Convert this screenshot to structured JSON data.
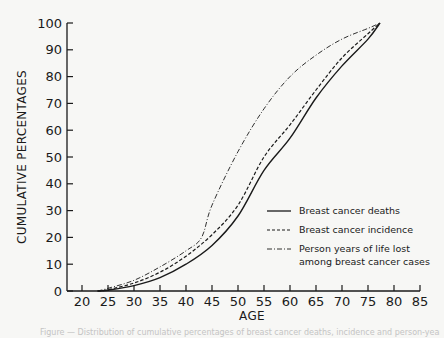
{
  "chart_data": {
    "type": "line",
    "title": "",
    "xlabel": "AGE",
    "ylabel": "CUMULATIVE PERCENTAGES",
    "xlim": [
      17,
      85
    ],
    "ylim": [
      0,
      100
    ],
    "xticks": [
      20,
      25,
      30,
      35,
      40,
      45,
      50,
      55,
      60,
      65,
      70,
      75,
      80,
      85
    ],
    "yticks": [
      0,
      10,
      20,
      30,
      40,
      50,
      60,
      70,
      80,
      90,
      100
    ],
    "grid": false,
    "legend_position": "lower right (inside plot)",
    "series": [
      {
        "name": "Breast cancer deaths",
        "style": "solid",
        "x": [
          23,
          25,
          30,
          35,
          40,
          45,
          50,
          55,
          60,
          65,
          70,
          75,
          77.3
        ],
        "y": [
          0,
          0.3,
          2,
          5,
          10,
          17,
          28,
          45,
          57,
          72,
          84,
          94,
          100
        ]
      },
      {
        "name": "Breast cancer incidence",
        "style": "dashed",
        "x": [
          23,
          25,
          30,
          35,
          40,
          45,
          50,
          55,
          60,
          65,
          70,
          75,
          77.3
        ],
        "y": [
          0,
          0.5,
          3,
          7,
          13,
          21,
          32,
          50,
          62,
          75,
          87,
          96,
          100
        ]
      },
      {
        "name": "Person years of life lost among breast cancer cases",
        "style": "dash-dot",
        "x": [
          23,
          25,
          30,
          35,
          40,
          43,
          45,
          50,
          55,
          60,
          65,
          70,
          75,
          77.3
        ],
        "y": [
          0,
          1,
          4,
          9,
          15,
          20,
          32,
          52,
          68,
          80,
          88,
          94,
          98,
          100
        ]
      }
    ]
  },
  "axes": {
    "xlabel": "AGE",
    "ylabel": "CUMULATIVE PERCENTAGES",
    "xtick_labels": [
      "20",
      "25",
      "30",
      "35",
      "40",
      "45",
      "50",
      "55",
      "60",
      "65",
      "70",
      "75",
      "80",
      "85"
    ],
    "ytick_labels": [
      "0",
      "10",
      "20",
      "30",
      "40",
      "50",
      "60",
      "70",
      "80",
      "90",
      "100"
    ]
  },
  "legend": {
    "items": [
      {
        "label": "Breast cancer deaths",
        "style": "solid"
      },
      {
        "label": "Breast cancer incidence",
        "style": "dashed"
      },
      {
        "label_line1": "Person  years of life lost",
        "label_line2": "among breast cancer cases",
        "style": "dash-dot"
      }
    ]
  },
  "caption": {
    "text": "Figure — Distribution of cumulative percentages of breast cancer deaths, incidence and person-years of life lost by age"
  },
  "colors": {
    "ink": "#1a1a1a",
    "background": "#f7f7f5"
  }
}
